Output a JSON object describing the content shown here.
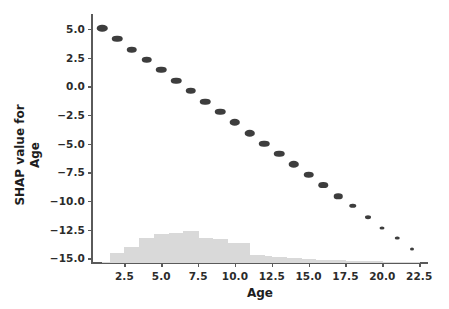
{
  "chart_data": {
    "type": "scatter",
    "title": "",
    "xlabel": "Age",
    "ylabel": "SHAP value for\nAge",
    "ylabel_lines": [
      "SHAP value for",
      "Age"
    ],
    "xlim": [
      0.3,
      23.1
    ],
    "ylim": [
      -15.4,
      5.6
    ],
    "xticks": [
      2.5,
      5.0,
      7.5,
      10.0,
      12.5,
      15.0,
      17.5,
      20.0,
      22.5
    ],
    "xtick_labels": [
      "2.5",
      "5.0",
      "7.5",
      "10.0",
      "12.5",
      "15.0",
      "17.5",
      "20.0",
      "22.5"
    ],
    "yticks": [
      5.0,
      2.5,
      0.0,
      -2.5,
      -5.0,
      -7.5,
      -10.0,
      -12.5,
      -15.0
    ],
    "ytick_labels": [
      "5.0",
      "2.5",
      "0.0",
      "−2.5",
      "−5.0",
      "−7.5",
      "−10.0",
      "−12.5",
      "−15.0"
    ],
    "grid": false,
    "legend": null,
    "point_color": "#3d3d3d",
    "hist_color": "#d9d9d9",
    "x": [
      1,
      2,
      3,
      4,
      5,
      6,
      7,
      8,
      9,
      10,
      11,
      12,
      13,
      14,
      15,
      16,
      17,
      18,
      19,
      20,
      21,
      22
    ],
    "y": [
      5.05,
      4.15,
      3.2,
      2.3,
      1.45,
      0.5,
      -0.4,
      -1.35,
      -2.2,
      -3.15,
      -4.1,
      -5.0,
      -5.9,
      -6.8,
      -7.7,
      -8.6,
      -9.6,
      -10.4,
      -11.4,
      -12.35,
      -13.25,
      -14.2
    ],
    "point_sizes": [
      10.5,
      10.5,
      10.5,
      10.5,
      10.5,
      10.5,
      10.5,
      10.5,
      10.5,
      10.5,
      10.5,
      10.5,
      10.5,
      10.5,
      10.5,
      9.5,
      8.5,
      7.5,
      6.0,
      5.0,
      4.5,
      4.0
    ],
    "histogram": {
      "description": "Age distribution rug histogram drawn along the bottom of the axes",
      "bin_edges": [
        1.0,
        1.5,
        2.0,
        2.5,
        3.0,
        3.5,
        4.0,
        4.5,
        5.0,
        5.5,
        6.0,
        6.5,
        7.0,
        7.5,
        8.0,
        8.5,
        9.0,
        9.5,
        10.0,
        10.5,
        11.0,
        11.5,
        12.0,
        12.5,
        13.0,
        13.5,
        14.0,
        14.5,
        15.0,
        15.5,
        16.0,
        16.5,
        17.0,
        17.5,
        18.0,
        18.5,
        19.0,
        19.5,
        20.0,
        20.5,
        21.0,
        21.5,
        22.0,
        22.5
      ],
      "counts": [
        0.04,
        0.28,
        0.28,
        0.46,
        0.46,
        0.72,
        0.72,
        0.86,
        0.86,
        0.88,
        0.88,
        0.94,
        0.94,
        0.72,
        0.72,
        0.7,
        0.7,
        0.6,
        0.6,
        0.58,
        0.22,
        0.22,
        0.2,
        0.18,
        0.18,
        0.14,
        0.14,
        0.12,
        0.12,
        0.1,
        0.1,
        0.09,
        0.09,
        0.07,
        0.07,
        0.06,
        0.05,
        0.05,
        0.04,
        0.03,
        0.03,
        0.02,
        0.02
      ],
      "max_height_units": 2.8,
      "baseline": -15.0
    }
  },
  "figure": {
    "background_color": "#ffffff",
    "spine_color": "#5a5a5a",
    "text_color": "#1e1e1e"
  }
}
